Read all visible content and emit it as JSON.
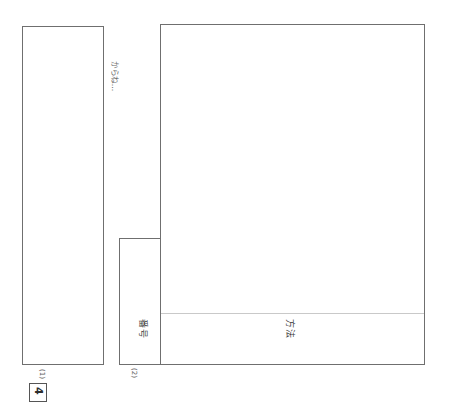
{
  "page": {
    "background_color": "#ffffff",
    "border_color": "#6f6f6f",
    "rule_color": "#c9c9c9",
    "text_color": "#3c3c3c"
  },
  "question": {
    "number": "4"
  },
  "answer_boxes": [
    {
      "marker": "(1)",
      "name": "answer-box-1",
      "note": "からね…"
    },
    {
      "marker": "(2)",
      "name": "answer-box-2",
      "column_labels": [
        "番号",
        "方法"
      ]
    }
  ],
  "labels": {
    "bango": "番号",
    "hoho": "方法",
    "marker_1": "(1)",
    "marker_2": "(2)",
    "kana_note": "からね…"
  }
}
